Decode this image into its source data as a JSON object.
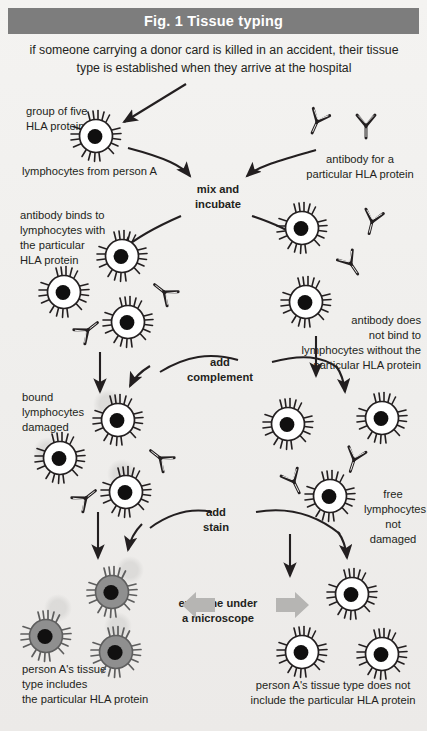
{
  "figure": {
    "header_title": "Fig. 1  Tissue typing",
    "header_color": "#7d7d7d",
    "background_color": "#f1f0ee",
    "ink_color": "#231f20",
    "stain_color": "#8c8c8c",
    "caption": "if someone carrying a donor card is killed in an accident, their tissue type is established when they arrive at the hospital"
  },
  "labels": {
    "hla_group": "group of five\nHLA proteins",
    "lymphocytes_person_a": "lymphocytes from person A",
    "antibody_for": "antibody for a\nparticular HLA protein",
    "mix_incubate": "mix and\nincubate",
    "antibody_binds": "antibody binds to\nlymphocytes with\nthe particular\nHLA protein",
    "antibody_not_bind": "antibody does\nnot bind to\nlymphocytes without the\nparticular HLA protein",
    "add_complement": "add\ncomplement",
    "bound_damaged": "bound\nlymphocytes\ndamaged",
    "free_not_damaged": "free\nlymphocytes\nnot damaged",
    "add_stain": "add\nstain",
    "examine": "examine under\na microscope",
    "result_positive": "person A's tissue\ntype includes\nthe particular HLA protein",
    "result_negative": "person A's tissue type does not\ninclude the particular HLA protein"
  },
  "icons": {
    "lymphocyte": "lymphocyte-cell-icon",
    "stained_lymphocyte": "stained-lymphocyte-cell-icon",
    "antibody": "y-shaped-antibody-icon",
    "arrow": "flow-arrow-icon",
    "block_arrow": "block-arrow-icon"
  }
}
